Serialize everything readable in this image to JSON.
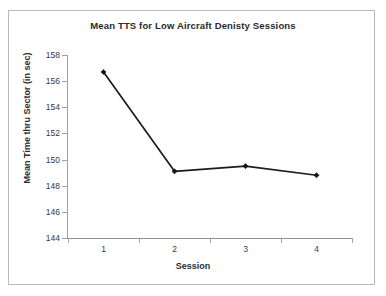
{
  "chart_data": {
    "type": "line",
    "title": "Mean TTS for Low Aircraft Denisty Sessions",
    "xlabel": "Session",
    "ylabel": "Mean Time thru Sector (in sec)",
    "categories": [
      "1",
      "2",
      "3",
      "4"
    ],
    "values": [
      156.7,
      149.1,
      149.5,
      148.8
    ],
    "series": [
      {
        "name": "Mean TTS",
        "values": [
          156.7,
          149.1,
          149.5,
          148.8
        ]
      }
    ],
    "yticks": [
      144,
      146,
      148,
      150,
      152,
      154,
      156,
      158
    ],
    "ytick_labels": [
      "144",
      "146",
      "148",
      "150",
      "152",
      "154",
      "156",
      "158"
    ],
    "ylim": [
      144,
      158
    ],
    "xlim": [
      0.5,
      4.5
    ],
    "grid": false,
    "legend": false,
    "legend_position": "none",
    "marker": "diamond",
    "line_color": "#1c1c1c",
    "marker_color": "#151515",
    "axis_color": "#a0a0a0",
    "frame_color": "#b9b9b9",
    "background": "#ffffff"
  }
}
